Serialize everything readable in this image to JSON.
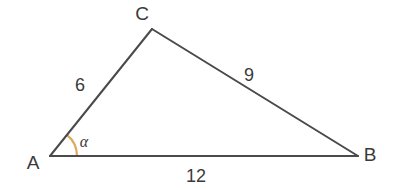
{
  "figure": {
    "kind": "triangle-diagram",
    "width": 397,
    "height": 190,
    "background_color": "#ffffff",
    "stroke_color": "#4a4a4a",
    "stroke_width": 2,
    "text_color": "#3a3a3a",
    "angle_arc_color": "#dba85c"
  },
  "vertices": {
    "a": {
      "label": "A",
      "x": 50,
      "y": 156,
      "label_x": 33,
      "label_y": 169
    },
    "b": {
      "label": "B",
      "x": 358,
      "y": 156,
      "label_x": 370,
      "label_y": 161
    },
    "c": {
      "label": "C",
      "x": 152,
      "y": 29,
      "label_x": 142,
      "label_y": 20
    }
  },
  "sides": [
    {
      "name": "side-ac",
      "label": "6",
      "label_x": 80,
      "label_y": 91,
      "from": "A",
      "to": "C"
    },
    {
      "name": "side-cb",
      "label": "9",
      "label_x": 249,
      "label_y": 81,
      "from": "C",
      "to": "B"
    },
    {
      "name": "side-ab",
      "label": "12",
      "label_x": 196,
      "label_y": 182,
      "from": "A",
      "to": "B"
    }
  ],
  "angle": {
    "name": "angle-alpha",
    "label": "α",
    "at_vertex": "A",
    "label_x": 84,
    "label_y": 147,
    "arc_radius": 27,
    "arc_color": "#dba85c"
  },
  "chart_data": {
    "type": "diagram",
    "shape": "triangle",
    "title": "",
    "vertex_labels": [
      "A",
      "B",
      "C"
    ],
    "side_lengths": {
      "AC": 6,
      "CB": 9,
      "AB": 12
    },
    "side_label_texts": [
      "6",
      "9",
      "12"
    ],
    "angles_marked": [
      {
        "vertex": "A",
        "symbol": "α",
        "marker": "arc",
        "marker_color": "#dba85c"
      }
    ],
    "coordinates": {
      "A": [
        50,
        156
      ],
      "B": [
        358,
        156
      ],
      "C": [
        152,
        29
      ]
    }
  }
}
